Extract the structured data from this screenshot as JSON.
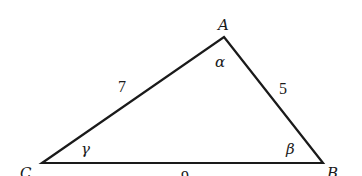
{
  "diagram": {
    "type": "triangle",
    "vertices": {
      "A": {
        "label": "A",
        "angle_label": "α"
      },
      "B": {
        "label": "B",
        "angle_label": "β"
      },
      "C": {
        "label": "C",
        "angle_label": "γ"
      }
    },
    "sides": {
      "CA": "7",
      "AB": "5",
      "CB": "9"
    },
    "stroke_color": "#1a1a1a",
    "background": "#ffffff"
  }
}
